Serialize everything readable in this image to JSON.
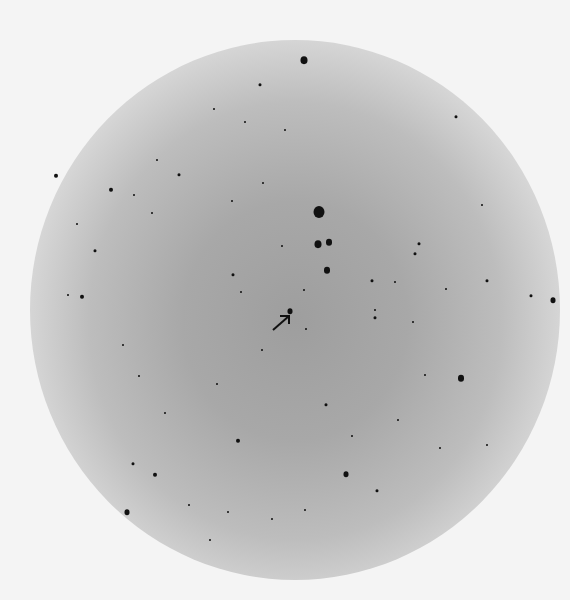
{
  "image": {
    "description": "Negative photographic plate of a star field with diffuse central glow",
    "annotation": "arrow pointing to a star near center",
    "arrow": {
      "x": 281,
      "y": 322,
      "direction": "up-right"
    },
    "stars": [
      [
        304,
        60,
        7
      ],
      [
        260,
        85,
        3
      ],
      [
        456,
        117,
        3
      ],
      [
        56,
        176,
        4
      ],
      [
        111,
        190,
        4
      ],
      [
        179,
        175,
        3
      ],
      [
        157,
        160,
        2
      ],
      [
        319,
        212,
        11
      ],
      [
        318,
        244,
        7
      ],
      [
        329,
        242,
        6
      ],
      [
        327,
        270,
        6
      ],
      [
        419,
        244,
        3
      ],
      [
        415,
        254,
        3
      ],
      [
        95,
        251,
        3
      ],
      [
        82,
        297,
        4
      ],
      [
        233,
        275,
        3
      ],
      [
        290,
        311,
        5
      ],
      [
        487,
        281,
        3
      ],
      [
        531,
        296,
        3
      ],
      [
        553,
        300,
        5
      ],
      [
        375,
        318,
        3
      ],
      [
        375,
        310,
        2
      ],
      [
        461,
        378,
        6
      ],
      [
        238,
        441,
        4
      ],
      [
        155,
        475,
        4
      ],
      [
        346,
        474,
        5
      ],
      [
        127,
        512,
        5
      ],
      [
        377,
        491,
        3
      ],
      [
        152,
        213,
        2
      ],
      [
        241,
        292,
        2
      ],
      [
        304,
        290,
        2
      ],
      [
        282,
        246,
        2
      ],
      [
        232,
        201,
        2
      ],
      [
        263,
        183,
        2
      ],
      [
        285,
        130,
        2
      ],
      [
        245,
        122,
        2
      ],
      [
        214,
        109,
        2
      ],
      [
        134,
        195,
        2
      ],
      [
        77,
        224,
        2
      ],
      [
        68,
        295,
        2
      ],
      [
        123,
        345,
        2
      ],
      [
        139,
        376,
        2
      ],
      [
        165,
        413,
        2
      ],
      [
        217,
        384,
        2
      ],
      [
        262,
        350,
        2
      ],
      [
        306,
        329,
        2
      ],
      [
        326,
        405,
        3
      ],
      [
        352,
        436,
        2
      ],
      [
        398,
        420,
        2
      ],
      [
        440,
        448,
        2
      ],
      [
        487,
        445,
        2
      ],
      [
        425,
        375,
        2
      ],
      [
        413,
        322,
        2
      ],
      [
        395,
        282,
        2
      ],
      [
        372,
        281,
        3
      ],
      [
        446,
        289,
        2
      ],
      [
        482,
        205,
        2
      ],
      [
        133,
        464,
        3
      ],
      [
        189,
        505,
        2
      ],
      [
        228,
        512,
        2
      ],
      [
        272,
        519,
        2
      ],
      [
        305,
        510,
        2
      ],
      [
        210,
        540,
        2
      ]
    ]
  }
}
